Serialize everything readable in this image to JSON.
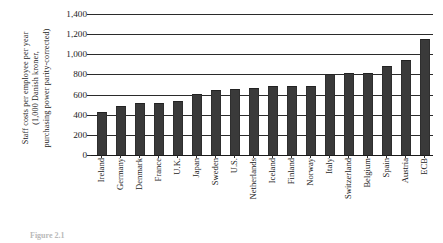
{
  "chart_data": {
    "type": "bar",
    "title": "",
    "xlabel": "",
    "ylabel": "Staff costs per employee per year (1,000 Danish kroner, purchasing power parity-corrected)",
    "ylabel_lines": [
      "Staff costs per employee per year",
      "(1,000 Danish kroner,",
      "purchasing power parity-corrected)"
    ],
    "ylim": [
      0,
      1400
    ],
    "ytick_values": [
      0,
      200,
      400,
      600,
      800,
      1000,
      1200,
      1400
    ],
    "ytick_labels": [
      "0",
      "200",
      "400",
      "600",
      "800",
      "1,000",
      "1,200",
      "1,400"
    ],
    "grid": true,
    "legend": "none",
    "bar_color": "#3a3a3a",
    "axis_color": "#2b2b2b",
    "categories": [
      "Ireland",
      "Germany",
      "Denmark",
      "France",
      "U.K.",
      "Japan",
      "Sweden",
      "U.S.",
      "Netherlands",
      "Iceland",
      "Finland",
      "Norway",
      "Italy",
      "Switzerland",
      "Belgium",
      "Spain",
      "Austria",
      "ECB"
    ],
    "values": [
      420,
      480,
      510,
      505,
      530,
      595,
      640,
      645,
      660,
      675,
      680,
      680,
      790,
      800,
      800,
      870,
      935,
      1140
    ]
  },
  "caption": {
    "figure_number": "Figure 2.1",
    "text": ""
  }
}
